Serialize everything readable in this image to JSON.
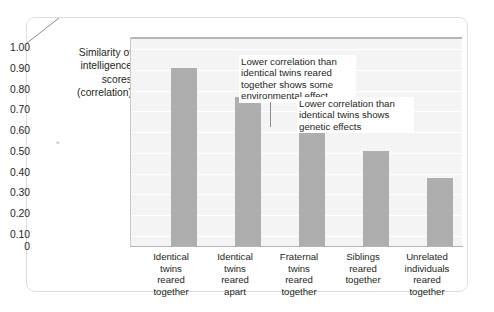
{
  "chart_data": {
    "type": "bar",
    "title": "",
    "xlabel": "",
    "ylabel": "Similarity of intelligence scores (correlation)",
    "ylabel_lines": [
      "Similarity of",
      "intelligence",
      "scores",
      "(correlation)"
    ],
    "categories": [
      "Identical twins reared together",
      "Identical twins reared apart",
      "Fraternal twins reared together",
      "Siblings reared together",
      "Unrelated individuals reared together"
    ],
    "category_lines": [
      [
        "Identical",
        "twins",
        "reared",
        "together"
      ],
      [
        "Identical",
        "twins",
        "reared",
        "apart"
      ],
      [
        "Fraternal",
        "twins",
        "reared",
        "together"
      ],
      [
        "Siblings",
        "reared",
        "together"
      ],
      [
        "Unrelated",
        "individuals",
        "reared",
        "together"
      ]
    ],
    "values": [
      0.86,
      0.72,
      0.6,
      0.46,
      0.33
    ],
    "ylim": [
      0,
      1.0
    ],
    "ytick_values": [
      1.0,
      0.9,
      0.8,
      0.7,
      0.6,
      0.5,
      0.4,
      0.3,
      0.2,
      0.1,
      0
    ],
    "ytick_labels": [
      "1.00",
      "0.90",
      "0.80",
      "0.70",
      "0.60",
      "0.50",
      "0.40",
      "0.30",
      "0.20",
      "0.10",
      "0"
    ],
    "grid": true,
    "legend": "none",
    "bar_color": "#aeaeae",
    "plot_background": "#f4f4f4",
    "gridline_color": "#ffffff",
    "annotations": [
      {
        "id": "environmental",
        "text": "Lower correlation than identical twins reared together shows some environmental effect",
        "lines": [
          "Lower correlation than",
          "identical twins reared",
          "together shows some",
          "environmental effect"
        ],
        "points_to": "Identical twins reared apart",
        "leader": "vertical"
      },
      {
        "id": "genetic",
        "text": "Lower correlation than identical twins shows genetic effects",
        "lines": [
          "Lower correlation than",
          "identical twins shows",
          "genetic effects"
        ],
        "points_to": "Fraternal twins reared together",
        "leader": "diagonal"
      }
    ]
  },
  "marks": {
    "stray_asterisk": "*"
  }
}
